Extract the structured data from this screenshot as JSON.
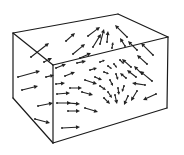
{
  "figure": {
    "width": 184,
    "height": 155,
    "colors": {
      "edge": "#1a1a1a",
      "arrow": "#222222",
      "background": "#ffffff"
    }
  },
  "box": {
    "vertices": {
      "back_top_left": [
        13,
        33
      ],
      "back_top_right": [
        118,
        14
      ],
      "front_top_left": [
        53,
        65
      ],
      "front_top_right": [
        168,
        37
      ],
      "back_bottom_left": [
        13,
        98
      ],
      "front_bottom_left": [
        53,
        143
      ],
      "front_bottom_right": [
        167,
        108
      ]
    },
    "edges": [
      [
        "back_top_left",
        "back_top_right"
      ],
      [
        "back_top_right",
        "front_top_right"
      ],
      [
        "back_top_left",
        "front_top_left"
      ],
      [
        "front_top_left",
        "front_top_right"
      ],
      [
        "back_top_left",
        "back_bottom_left"
      ],
      [
        "front_top_left",
        "front_bottom_left"
      ],
      [
        "front_top_right",
        "front_bottom_right"
      ],
      [
        "back_bottom_left",
        "front_bottom_left"
      ],
      [
        "front_bottom_left",
        "front_bottom_right"
      ]
    ]
  },
  "arrows": [
    [
      31,
      57,
      49,
      43
    ],
    [
      66,
      41,
      75,
      33
    ],
    [
      73,
      54,
      85,
      44
    ],
    [
      88,
      36,
      100,
      27
    ],
    [
      93,
      47,
      101,
      34
    ],
    [
      100,
      44,
      104,
      29
    ],
    [
      107,
      42,
      108,
      31
    ],
    [
      127,
      37,
      115,
      25
    ],
    [
      125,
      46,
      120,
      38
    ],
    [
      137,
      50,
      128,
      41
    ],
    [
      153,
      55,
      141,
      43
    ],
    [
      44,
      62,
      52,
      58
    ],
    [
      80,
      58,
      91,
      53
    ],
    [
      112,
      48,
      113,
      42
    ],
    [
      18,
      77,
      40,
      71
    ],
    [
      22,
      90,
      38,
      86
    ],
    [
      38,
      106,
      53,
      103
    ],
    [
      35,
      119,
      50,
      123
    ],
    [
      46,
      77,
      54,
      75
    ],
    [
      56,
      68,
      66,
      64
    ],
    [
      65,
      76,
      75,
      72
    ],
    [
      56,
      84,
      65,
      83
    ],
    [
      57,
      94,
      70,
      93
    ],
    [
      70,
      88,
      82,
      88
    ],
    [
      68,
      103,
      80,
      104
    ],
    [
      57,
      103,
      71,
      103
    ],
    [
      68,
      111,
      80,
      111
    ],
    [
      85,
      108,
      98,
      112
    ],
    [
      62,
      128,
      80,
      127
    ],
    [
      82,
      92,
      93,
      95
    ],
    [
      85,
      80,
      97,
      84
    ],
    [
      77,
      63,
      86,
      61
    ],
    [
      90,
      70,
      97,
      68
    ],
    [
      100,
      62,
      105,
      60
    ],
    [
      95,
      77,
      102,
      80
    ],
    [
      104,
      72,
      109,
      74
    ],
    [
      108,
      66,
      112,
      69
    ],
    [
      100,
      86,
      106,
      90
    ],
    [
      110,
      80,
      113,
      86
    ],
    [
      116,
      74,
      118,
      80
    ],
    [
      114,
      64,
      117,
      68
    ],
    [
      108,
      92,
      112,
      98
    ],
    [
      104,
      98,
      110,
      104
    ],
    [
      118,
      88,
      119,
      95
    ],
    [
      124,
      86,
      122,
      92
    ],
    [
      120,
      60,
      124,
      64
    ],
    [
      131,
      67,
      122,
      59
    ],
    [
      136,
      77,
      127,
      70
    ],
    [
      147,
      64,
      137,
      55
    ],
    [
      152,
      81,
      140,
      71
    ],
    [
      145,
      85,
      132,
      83
    ],
    [
      156,
      94,
      143,
      100
    ],
    [
      115,
      95,
      117,
      104
    ],
    [
      128,
      96,
      124,
      105
    ],
    [
      137,
      91,
      131,
      101
    ],
    [
      142,
      74,
      134,
      66
    ],
    [
      126,
      78,
      120,
      73
    ]
  ]
}
